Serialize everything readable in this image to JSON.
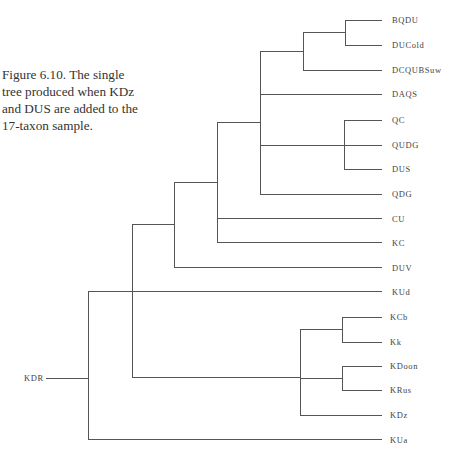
{
  "caption": {
    "lines": [
      "Figure 6.10. The single",
      "tree produced when KDz",
      "and DUS are added to the",
      "17-taxon sample."
    ]
  },
  "style": {
    "line_color": "#555555",
    "text_color": "#444444"
  },
  "tree": {
    "root_label": "KDR",
    "leaves": [
      {
        "label": "BQDU",
        "y": 20
      },
      {
        "label": "DUCold",
        "y": 45
      },
      {
        "label": "DCQUBSuw",
        "y": 70
      },
      {
        "label": "DAQS",
        "y": 94
      },
      {
        "label": "QC",
        "y": 120
      },
      {
        "label": "QUDG",
        "y": 145
      },
      {
        "label": "DUS",
        "y": 169
      },
      {
        "label": "QDG",
        "y": 194
      },
      {
        "label": "CU",
        "y": 219
      },
      {
        "label": "KC",
        "y": 243
      },
      {
        "label": "DUV",
        "y": 268
      },
      {
        "label": "KUd",
        "y": 292
      },
      {
        "label": "KCb",
        "y": 317
      },
      {
        "label": "Kk",
        "y": 342
      },
      {
        "label": "KDoon",
        "y": 366
      },
      {
        "label": "KRus",
        "y": 390
      },
      {
        "label": "KDz",
        "y": 415
      },
      {
        "label": "KUa",
        "y": 440
      }
    ]
  }
}
